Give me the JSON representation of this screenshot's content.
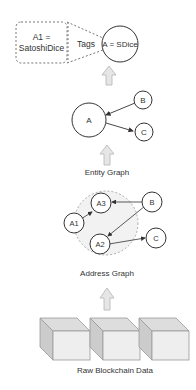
{
  "diagram": {
    "tag_box": {
      "line1": "A1 =",
      "line2": "SatoshiDice"
    },
    "tags_label": "Tags",
    "entity_tag_node": "A = SDice",
    "entity_graph": {
      "label": "Entity Graph",
      "nodes": [
        "A",
        "B",
        "C"
      ],
      "edges": [
        [
          "B",
          "A"
        ],
        [
          "A",
          "C"
        ]
      ]
    },
    "address_graph": {
      "label": "Address Graph",
      "nodes": [
        "A1",
        "A2",
        "A3",
        "B",
        "C"
      ],
      "cluster": [
        "A1",
        "A2",
        "A3"
      ],
      "edges": [
        [
          "A1",
          "A3"
        ],
        [
          "B",
          "A3"
        ],
        [
          "B",
          "A2"
        ],
        [
          "A2",
          "C"
        ]
      ]
    },
    "raw_data": {
      "label": "Raw Blockchain Data",
      "blocks": 3
    },
    "colors": {
      "stroke": "#333333",
      "dashed": "#777777",
      "arrow_fill": "#e6e6e6",
      "arrow_stroke": "#b3b3b3",
      "cluster_fill": "#f2f2f2",
      "block_front": "#eeeeee",
      "block_top": "#dddddd",
      "block_side": "#cccccc"
    }
  }
}
